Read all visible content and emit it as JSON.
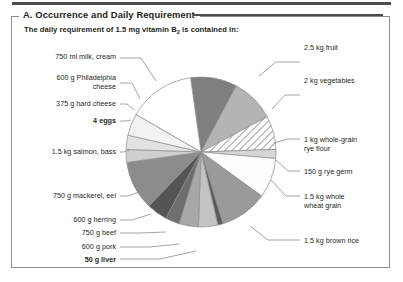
{
  "panel": {
    "title": "A. Occurrence and Daily Requirement",
    "subtitle_pre": "The daily requirement of 1.5 mg vitamin B",
    "subtitle_sub": "2",
    "subtitle_post": " is contained in:"
  },
  "chart_data": {
    "type": "pie",
    "title": "The daily requirement of 1.5 mg vitamin B2 is contained in:",
    "legend": "none",
    "units": "equal share per food item (each slice = one food portion supplying the daily requirement)",
    "categories": [
      "2.5 kg fruit",
      "2 kg vegetables",
      "1 kg whole-grain rye flour",
      "150 g rye germ",
      "1.5 kg whole wheat grain",
      "1.5 kg brown rice",
      "50 g liver",
      "600 g pork",
      "750 g beef",
      "600 g herring",
      "750 g mackerel, eel",
      "1.5 kg salmon, bass",
      "4 eggs",
      "375 g hard cheese",
      "600 g Philadelphia cheese",
      "750 ml milk, cream"
    ],
    "values": [
      40,
      28,
      18,
      5,
      22,
      30,
      3,
      14,
      16,
      8,
      24,
      34,
      9,
      12,
      16,
      25
    ],
    "slices": [
      {
        "label": "2.5 kg fruit",
        "start": 352,
        "end": 28,
        "fill": "#7f7f7f",
        "pattern": "solid"
      },
      {
        "label": "2 kg vegetables",
        "start": 28,
        "end": 62,
        "fill": "#b4b4b4",
        "pattern": "solid"
      },
      {
        "label": "1 kg whole-grain rye flour",
        "start": 62,
        "end": 88,
        "fill": "#ffffff",
        "pattern": "diagonal-hatch"
      },
      {
        "label": "150 g rye germ",
        "start": 88,
        "end": 95,
        "fill": "#d6d6d6",
        "pattern": "solid"
      },
      {
        "label": "1.5 kg whole wheat grain",
        "start": 95,
        "end": 126,
        "fill": "#fdfdfd",
        "pattern": "solid"
      },
      {
        "label": "1.5 kg brown rice",
        "start": 126,
        "end": 163,
        "fill": "#9a9a9a",
        "pattern": "solid"
      },
      {
        "label": "50 g liver",
        "start": 163,
        "end": 167,
        "fill": "#5a5a5a",
        "pattern": "solid"
      },
      {
        "label": "600 g pork",
        "start": 167,
        "end": 182,
        "fill": "#c3c3c3",
        "pattern": "solid"
      },
      {
        "label": "750 g beef",
        "start": 182,
        "end": 197,
        "fill": "#a8a8a8",
        "pattern": "solid"
      },
      {
        "label": "600 g herring",
        "start": 197,
        "end": 208,
        "fill": "#6e6e6e",
        "pattern": "solid"
      },
      {
        "label": "750 g mackerel, eel",
        "start": 208,
        "end": 224,
        "fill": "#545454",
        "pattern": "solid"
      },
      {
        "label": "1.5 kg salmon, bass",
        "start": 224,
        "end": 262,
        "fill": "#8c8c8c",
        "pattern": "solid"
      },
      {
        "label": "4 eggs",
        "start": 262,
        "end": 272,
        "fill": "#cfcfcf",
        "pattern": "solid"
      },
      {
        "label": "375 g hard cheese",
        "start": 272,
        "end": 283,
        "fill": "#e2e2e2",
        "pattern": "solid"
      },
      {
        "label": "600 g Philadelphia cheese",
        "start": 283,
        "end": 300,
        "fill": "#f2f2f2",
        "pattern": "solid"
      },
      {
        "label": "750 ml milk, cream",
        "start": 300,
        "end": 352,
        "fill": "#ffffff",
        "pattern": "solid"
      }
    ]
  },
  "labels": {
    "left": [
      {
        "text": "750 ml milk, cream",
        "bold": false
      },
      {
        "text": "600 g Philadelphia\ncheese",
        "bold": false
      },
      {
        "text": "375 g hard cheese",
        "bold": false
      },
      {
        "text": "4 eggs",
        "bold": true
      },
      {
        "text": "1.5 kg salmon, bass",
        "bold": false
      },
      {
        "text": "750 g mackerel, eel",
        "bold": false
      },
      {
        "text": "600 g herring",
        "bold": false
      },
      {
        "text": "750 g beef",
        "bold": false
      },
      {
        "text": "600 g pork",
        "bold": false
      },
      {
        "text": "50 g liver",
        "bold": true
      }
    ],
    "right": [
      {
        "text": "2.5 kg fruit",
        "bold": false
      },
      {
        "text": "2 kg vegetables",
        "bold": false
      },
      {
        "text": "1 kg whole-grain\nrye flour",
        "bold": false
      },
      {
        "text": "150 g rye germ",
        "bold": false
      },
      {
        "text": "1.5 kg whole\nwheat grain",
        "bold": false
      },
      {
        "text": "1.5 kg brown rice",
        "bold": false
      }
    ]
  },
  "colors": {
    "frame": "#8d8d8d",
    "rule": "#4c4c4c",
    "text": "#231f20"
  }
}
